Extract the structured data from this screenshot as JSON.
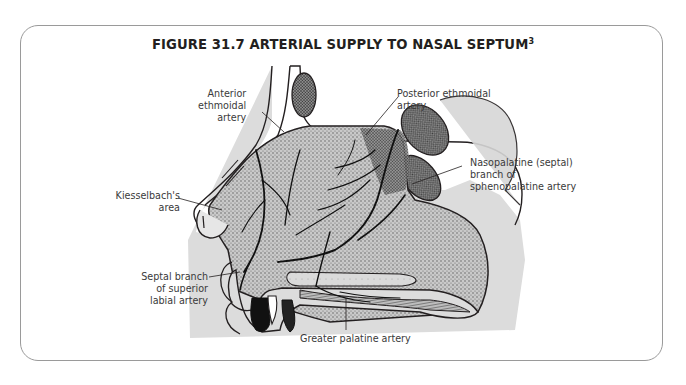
{
  "figure": {
    "title": "FIGURE 31.7 ARTERIAL SUPPLY TO NASAL SEPTUM",
    "title_superscript": "3"
  },
  "labels": {
    "anterior_ethmoidal": [
      "Anterior",
      "ethmoidal",
      "artery"
    ],
    "posterior_ethmoidal": [
      "Posterior ethmoidal",
      "artery"
    ],
    "nasopalatine": [
      "Nasopalatine (septal)",
      "branch of",
      "sphenopalatine artery"
    ],
    "kiesselbach": [
      "Kiesselbach's",
      "area"
    ],
    "septal_branch": [
      "Septal branch",
      "of superior",
      "labial artery"
    ],
    "greater_palatine": [
      "Greater palatine artery"
    ]
  },
  "colors": {
    "ink": "#231f20",
    "label_text": "#3a3a3a",
    "frame_border": "#9a9a9a",
    "tissue_light": "#d9d9d9",
    "tissue_dark": "#8c8c8c",
    "background": "#ffffff"
  }
}
